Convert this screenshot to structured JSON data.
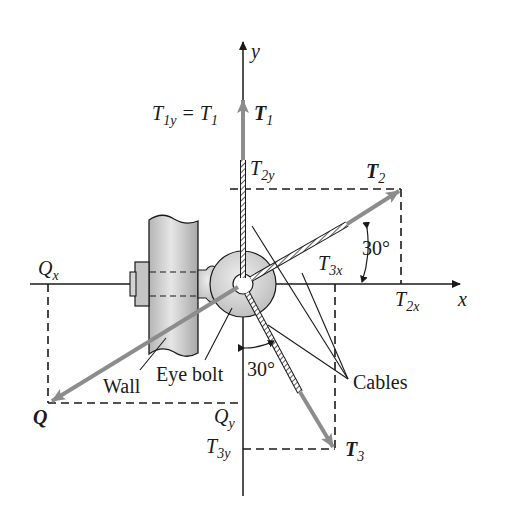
{
  "figure": {
    "type": "free-body force diagram"
  },
  "axes": {
    "x_label": "x",
    "y_label": "y",
    "origin": [
      243,
      284
    ]
  },
  "forces": [
    {
      "name": "T1",
      "label": "T",
      "sub": "1",
      "angle_note": "vertical, along +y"
    },
    {
      "name": "T2",
      "label": "T",
      "sub": "2",
      "angle_deg_from_x": 30
    },
    {
      "name": "T3",
      "label": "T",
      "sub": "3",
      "angle_deg_from_neg_y": 30
    },
    {
      "name": "Q",
      "label": "Q",
      "sub": ""
    }
  ],
  "component_labels": {
    "t1y_eq": {
      "lhs": "T",
      "lhs_sub": "1y",
      "eq": " = ",
      "rhs": "T",
      "rhs_sub": "1"
    },
    "t2y": {
      "main": "T",
      "sub": "2y"
    },
    "t2x": {
      "main": "T",
      "sub": "2x"
    },
    "t3x": {
      "main": "T",
      "sub": "3x"
    },
    "t3y": {
      "main": "T",
      "sub": "3y"
    },
    "qx": {
      "main": "Q",
      "sub": "x"
    },
    "qy": {
      "main": "Q",
      "sub": "y"
    }
  },
  "angles": {
    "t2_angle": "30°",
    "t3_angle": "30°"
  },
  "callouts": {
    "wall": "Wall",
    "eye_bolt": "Eye bolt",
    "cables": "Cables"
  },
  "colors": {
    "line": "#1a1a1a",
    "force_vector": "#8c8c8c",
    "wall_fill": "#c9c9c9",
    "disc_fill": "#d6d6d6"
  }
}
